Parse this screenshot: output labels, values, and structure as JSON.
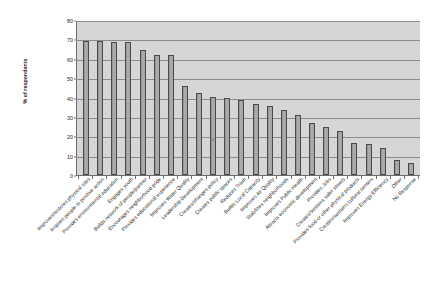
{
  "chart_data": {
    "type": "bar",
    "title": "",
    "xlabel": "",
    "ylabel": "% of respondents",
    "ylim": [
      0,
      80
    ],
    "yticks": [
      0,
      10,
      20,
      30,
      40,
      50,
      60,
      70,
      80
    ],
    "grid": true,
    "legend": "none",
    "orientation": "vertical",
    "categories": [
      "Improves/restores physical sites",
      "Inspires people to positive action",
      "Provides environmental education",
      "Engages youth",
      "Builds network of people/partner",
      "Encourages neighborhood pride",
      "Provides educational experience",
      "Improves Water Quality",
      "Leadership Development",
      "Creates/changes policy",
      "Creates public spaces",
      "Reduces Trash",
      "Builds Local Capacity",
      "Improves Air Quality",
      "Stabilizes neighborhoods",
      "Improves Public Health",
      "Attracts economic development",
      "Provides Jobs",
      "Creates/sustains safer streets",
      "Provides food or other physical products",
      "Creates/sustains cultural centers",
      "Improves Energy Efficiency",
      "Other",
      "No Response"
    ],
    "values": [
      69,
      69,
      68.5,
      68.5,
      64.5,
      62,
      62,
      46,
      42.5,
      40.5,
      40,
      38.5,
      36.5,
      35.5,
      33.5,
      31,
      27,
      25,
      22.5,
      16.5,
      16,
      14,
      7.5,
      6
    ],
    "colors": {
      "bar_fill": "#a0a0a0",
      "bar_edge": "#4a4a4a",
      "plot_background": "#d6d6d6",
      "gridline": "#8c8c8c",
      "axis": "#6d6d6d",
      "text": "#1f1f1f",
      "page_background": "#ffffff"
    }
  }
}
